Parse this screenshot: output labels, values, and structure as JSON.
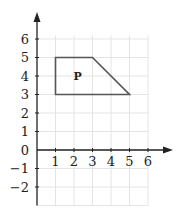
{
  "diagram": {
    "type": "coordinate-grid",
    "origin_px": [
      37,
      150
    ],
    "unit_px": 18.5,
    "x_ticks": [
      "1",
      "2",
      "3",
      "4",
      "5",
      "6"
    ],
    "y_ticks_positive": [
      "1",
      "2",
      "3",
      "4",
      "5",
      "6"
    ],
    "y_ticks_negative": [
      "−1",
      "−2"
    ],
    "origin_label": "0",
    "shape": {
      "label": "P",
      "vertices": [
        [
          1,
          5
        ],
        [
          3,
          5
        ],
        [
          5,
          3
        ],
        [
          1,
          3
        ]
      ],
      "label_position": [
        2.2,
        4
      ]
    },
    "grid_range": {
      "xmin": 0,
      "xmax": 6,
      "ymin": -3,
      "ymax": 6.2
    },
    "colors": {
      "grid": "#e4e4e4",
      "axis": "#222222",
      "shape": "#555555"
    }
  }
}
